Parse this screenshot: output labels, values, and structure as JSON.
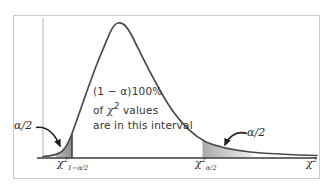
{
  "labels": {
    "left_tail_area": "α/2",
    "right_tail_area": "α/2",
    "center_line1": "(1 − α)100%",
    "center_line2_pre": "of ",
    "center_line2_chi": "χ",
    "center_line2_sup": "2",
    "center_line2_post": " values",
    "center_line3": "are in this interval",
    "axis_label_left": {
      "base": "χ",
      "sup": "2",
      "sub": "1−α/2"
    },
    "axis_label_right": {
      "base": "χ",
      "sup": "2",
      "sub": "α/2"
    },
    "axis_label_end": {
      "base": "χ",
      "sup": "2"
    }
  },
  "colors": {
    "curve": "#4a4a4a",
    "axis": "#3a3a3a",
    "yaxis": "#b6b6b6",
    "frame": "#cbcbcb",
    "text": "#2b2b2b",
    "shade": "#9a9a9a",
    "arrow": "#1f1f1f"
  }
}
